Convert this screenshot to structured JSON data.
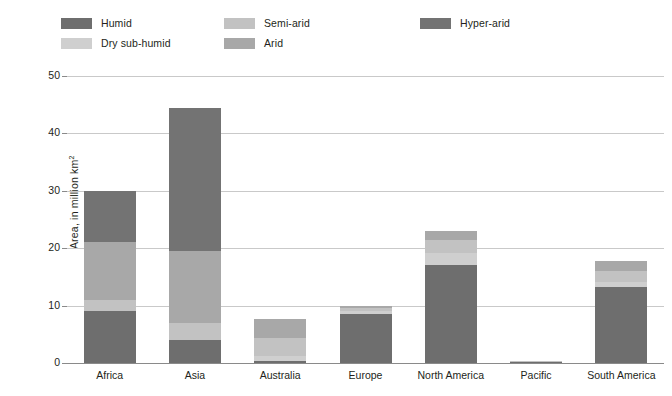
{
  "chart_data": {
    "type": "bar",
    "subtype": "stacked-vertical",
    "title": "",
    "subtitle": "",
    "xlabel": "",
    "ylabel": "Area, in million km²",
    "ylim": [
      0,
      50
    ],
    "yticks": [
      0,
      10,
      20,
      30,
      40,
      50
    ],
    "ytick_labels": [
      "0",
      "10",
      "20",
      "30",
      "40",
      "50"
    ],
    "grid": true,
    "grid_axis": "y",
    "legend_position": "top",
    "categories": [
      "Africa",
      "Asia",
      "Australia",
      "Europe",
      "North America",
      "Pacific",
      "South America"
    ],
    "series": [
      {
        "name": "Humid",
        "color": "#6e6e6e",
        "values": [
          9.0,
          4.0,
          0.3,
          8.5,
          17.0,
          0.35,
          13.2
        ]
      },
      {
        "name": "Dry sub-humid",
        "color": "#cfcfcf",
        "values": [
          0.0,
          0.0,
          1.0,
          0.6,
          2.2,
          0.02,
          1.0
        ]
      },
      {
        "name": "Semi-arid",
        "color": "#c2c2c2",
        "values": [
          2.0,
          3.0,
          3.1,
          0.5,
          2.3,
          0.02,
          1.9
        ]
      },
      {
        "name": "Arid",
        "color": "#a8a8a8",
        "values": [
          10.0,
          12.5,
          3.3,
          0.4,
          1.5,
          0.01,
          1.6
        ]
      },
      {
        "name": "Hyper-arid",
        "color": "#737373",
        "values": [
          9.0,
          25.0,
          0.0,
          0.0,
          0.0,
          0.0,
          0.0
        ]
      }
    ],
    "totals": [
      30.0,
      44.5,
      7.7,
      10.0,
      23.0,
      0.4,
      17.7
    ]
  },
  "legend": {
    "items": [
      {
        "label": "Humid",
        "color": "#6e6e6e",
        "col": 0,
        "row": 0
      },
      {
        "label": "Dry sub-humid",
        "color": "#cfcfcf",
        "col": 0,
        "row": 1
      },
      {
        "label": "Semi-arid",
        "color": "#c2c2c2",
        "col": 1,
        "row": 0
      },
      {
        "label": "Arid",
        "color": "#a8a8a8",
        "col": 1,
        "row": 1
      },
      {
        "label": "Hyper-arid",
        "color": "#737373",
        "col": 2,
        "row": 0
      }
    ]
  },
  "axes": {
    "y_axis_title": "Area, in million km²",
    "y_axis_title_unit_superscript": "2",
    "y_axis_title_base": "Area, in million km"
  },
  "colors": {
    "background": "#ffffff",
    "gridline": "#c9c9c9",
    "axis": "#8a8a8a",
    "text": "#231f20"
  }
}
